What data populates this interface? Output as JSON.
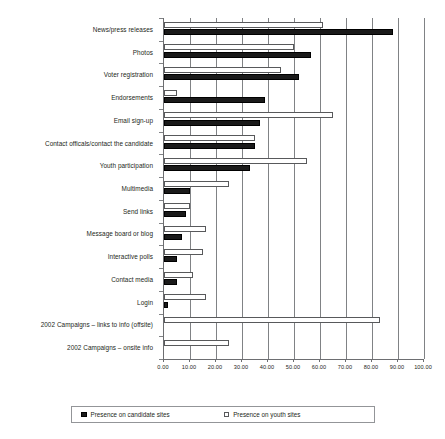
{
  "chart_data": {
    "type": "bar",
    "orientation": "horizontal",
    "title": "",
    "subtitle": "",
    "xlabel": "",
    "ylabel": "",
    "xlim": [
      0,
      100
    ],
    "grid": true,
    "legend_position": "bottom",
    "categories": [
      "News/press releases",
      "Photos",
      "Voter registration",
      "Endorsements",
      "Email sign-up",
      "Contact officals/contact the candidate",
      "Youth participation",
      "Multimedia",
      "Send links",
      "Message board or blog",
      "Interactive polls",
      "Contact media",
      "Login",
      "2002 Campaigns – links to info (offsite)",
      "2002 Campaigns – onsite info"
    ],
    "series": [
      {
        "name": "Presence on candidate sites",
        "color": "#1a1a1a",
        "values": [
          88.0,
          56.5,
          52.0,
          39.0,
          37.0,
          35.0,
          33.0,
          10.0,
          8.5,
          7.0,
          5.0,
          5.0,
          1.5,
          0,
          0
        ]
      },
      {
        "name": "Presence on youth sites",
        "color": "#ffffff",
        "values": [
          61.0,
          50.0,
          45.0,
          5.0,
          65.0,
          35.0,
          55.0,
          25.0,
          10.0,
          16.0,
          15.0,
          11.0,
          16.0,
          83.0,
          25.0
        ]
      }
    ],
    "xticks": [
      0,
      10,
      20,
      30,
      40,
      50,
      60,
      70,
      80,
      90,
      100
    ],
    "xtick_labels": [
      "0.00",
      "10.00",
      "20.00",
      "30.00",
      "40.00",
      "50.00",
      "60.00",
      "70.00",
      "80.00",
      "90.00",
      "100.00"
    ]
  },
  "legend": {
    "items": [
      {
        "label": "Presence on candidate sites",
        "marker": "filled-square-icon"
      },
      {
        "label": "Presence on youth sites",
        "marker": "empty-square-icon"
      }
    ]
  }
}
